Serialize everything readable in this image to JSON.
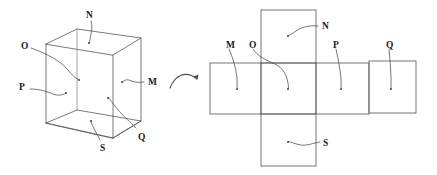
{
  "figure": {
    "stroke_color": "#58585c",
    "label_color": "#18181c",
    "background": "#ffffff",
    "transform_icon": "curved-arrow-right-icon"
  },
  "cube": {
    "name": "labelled-cube",
    "face_labels": [
      {
        "key": "N",
        "text": "N",
        "face": "top",
        "x": 86,
        "y": 11,
        "dot_x": 89,
        "dot_y": 43
      },
      {
        "key": "O",
        "text": "O",
        "face": "left-inner",
        "x": 21,
        "y": 42,
        "dot_x": 79,
        "dot_y": 80
      },
      {
        "key": "P",
        "text": "P",
        "face": "left",
        "x": 19,
        "y": 83,
        "dot_x": 66,
        "dot_y": 93
      },
      {
        "key": "M",
        "text": "M",
        "face": "right",
        "x": 148,
        "y": 78,
        "dot_x": 122,
        "dot_y": 82
      },
      {
        "key": "Q",
        "text": "Q",
        "face": "back",
        "x": 138,
        "y": 133,
        "dot_x": 108,
        "dot_y": 98
      },
      {
        "key": "S",
        "text": "S",
        "face": "bottom",
        "x": 100,
        "y": 144,
        "dot_x": 91,
        "dot_y": 121
      }
    ]
  },
  "net": {
    "name": "cube-net",
    "squares": [
      {
        "key": "M",
        "text": "M",
        "col": 0,
        "row": 1,
        "label_x": 226,
        "label_y": 41,
        "dot_x": 237,
        "dot_y": 89
      },
      {
        "key": "O",
        "text": "O",
        "col": 1,
        "row": 1,
        "label_x": 249,
        "label_y": 41,
        "dot_x": 288,
        "dot_y": 89
      },
      {
        "key": "N",
        "text": "N",
        "col": 1,
        "row": 0,
        "label_x": 322,
        "label_y": 22,
        "dot_x": 288,
        "dot_y": 36
      },
      {
        "key": "S",
        "text": "S",
        "col": 1,
        "row": 2,
        "label_x": 323,
        "label_y": 139,
        "dot_x": 288,
        "dot_y": 142
      },
      {
        "key": "P",
        "text": "P",
        "col": 2,
        "row": 1,
        "label_x": 333,
        "label_y": 41,
        "dot_x": 341,
        "dot_y": 89
      },
      {
        "key": "Q",
        "text": "Q",
        "col": 3,
        "row": 1,
        "label_x": 386,
        "label_y": 41,
        "dot_x": 391,
        "dot_y": 89
      }
    ]
  }
}
